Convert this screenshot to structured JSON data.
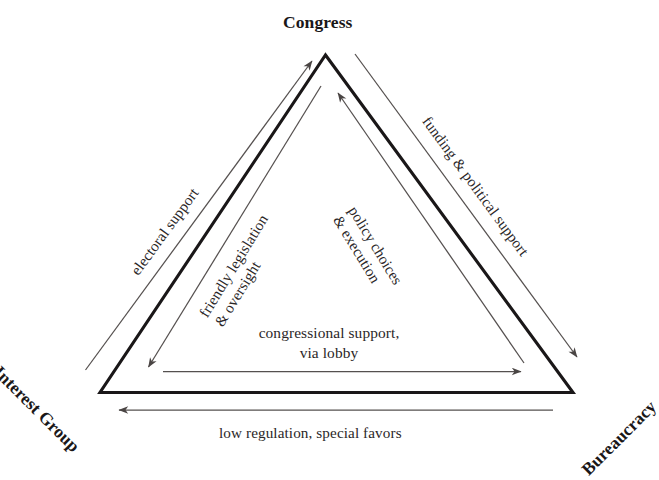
{
  "diagram": {
    "vertices": [
      {
        "id": "congress",
        "label": "Congress"
      },
      {
        "id": "interest-group",
        "label": "Interest Group"
      },
      {
        "id": "bureaucracy",
        "label": "Bureaucracy"
      }
    ],
    "edge_labels": [
      {
        "id": "electoral-support",
        "text": "electoral support",
        "from": "Interest Group",
        "to": "Congress",
        "side": "outer-left"
      },
      {
        "id": "funding-political-support",
        "text": "funding & political support",
        "from": "Congress",
        "to": "Bureaucracy",
        "side": "outer-right"
      },
      {
        "id": "low-regulation",
        "text": "low regulation, special favors",
        "from": "Bureaucracy",
        "to": "Interest Group",
        "side": "outer-bottom"
      },
      {
        "id": "friendly-legislation",
        "line1": "friendly legislation",
        "line2": "& oversight",
        "from": "Congress",
        "to": "Interest Group",
        "side": "inner-left"
      },
      {
        "id": "policy-choices",
        "line1": "policy choices",
        "line2": "& execution",
        "from": "Bureaucracy",
        "to": "Congress",
        "side": "inner-right"
      },
      {
        "id": "congressional-support",
        "line1": "congressional support,",
        "line2": "via lobby",
        "from": "Interest Group",
        "to": "Bureaucracy",
        "side": "inner-bottom"
      }
    ],
    "colors": {
      "triangle_stroke": "#1a1718",
      "arrow_stroke": "#55504f",
      "text": "#231f20",
      "background": "#ffffff"
    }
  }
}
